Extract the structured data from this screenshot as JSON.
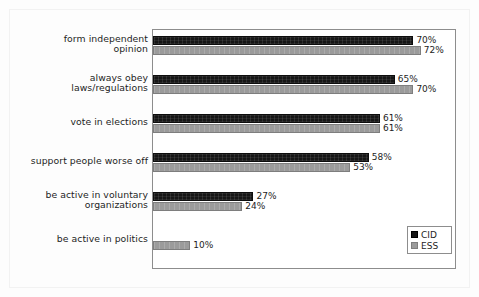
{
  "chart_data": {
    "type": "bar",
    "orientation": "horizontal",
    "title": "",
    "xlabel": "",
    "ylabel": "",
    "xlim": [
      0,
      80
    ],
    "grid": false,
    "legend_position": "bottom-right",
    "categories": [
      "form independent opinion",
      "always obey laws/regulations",
      "vote in elections",
      "support people worse off",
      "be active in voluntary organizations",
      "be active in politics"
    ],
    "category_label_lines": [
      [
        "form independent",
        "opinion"
      ],
      [
        "always obey",
        "laws/regulations"
      ],
      [
        "vote in elections"
      ],
      [
        "support people worse off"
      ],
      [
        "be active in voluntary",
        "organizations"
      ],
      [
        "be active in politics"
      ]
    ],
    "series": [
      {
        "name": "CID",
        "color": "#161616",
        "values": [
          70,
          65,
          61,
          58,
          27,
          null
        ],
        "value_labels": [
          "70%",
          "65%",
          "61%",
          "58%",
          "27%",
          ""
        ]
      },
      {
        "name": "ESS",
        "color": "#9b9b9b",
        "values": [
          72,
          70,
          61,
          53,
          24,
          10
        ],
        "value_labels": [
          "72%",
          "70%",
          "61%",
          "53%",
          "24%",
          "10%"
        ]
      }
    ]
  },
  "legend": {
    "entries": [
      {
        "label": "CID",
        "color": "#161616"
      },
      {
        "label": "ESS",
        "color": "#9b9b9b"
      }
    ]
  },
  "colors": {
    "cid_bar": "#161616",
    "ess_bar": "#9b9b9b",
    "plot_border": "#8d8d8d",
    "text": "#1d1d1d",
    "background": "#fdfdfd"
  }
}
